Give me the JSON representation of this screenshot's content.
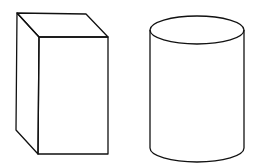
{
  "figure": {
    "width": 258,
    "height": 165,
    "background": "#ffffff",
    "stroke_color": "#111111",
    "shapes": [
      {
        "name": "rectangular-prism",
        "type": "box",
        "front_face": {
          "x1": 38,
          "y1": 37,
          "x2": 108,
          "y2": 154
        },
        "back_top_left": [
          17,
          13
        ],
        "back_top_right": [
          86,
          14
        ],
        "back_bottom_left": [
          16,
          130
        ]
      },
      {
        "name": "cylinder",
        "type": "cylinder",
        "cx": 197,
        "top_cy": 30,
        "bottom_cy": 148,
        "rx": 47,
        "ry": 14
      }
    ]
  }
}
